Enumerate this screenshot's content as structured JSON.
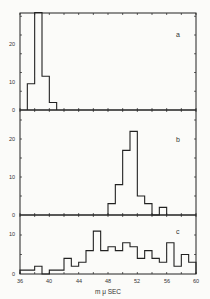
{
  "chart_data": [
    {
      "type": "bar",
      "panel": "a",
      "title": "",
      "xlabel": "",
      "ylabel": "",
      "xlim": [
        36,
        60
      ],
      "ylim": [
        0,
        28
      ],
      "yticks": [
        0,
        10,
        20
      ],
      "bin_width": 1,
      "bins": [
        37,
        38,
        39,
        40
      ],
      "values": [
        7,
        26,
        9,
        2
      ]
    },
    {
      "type": "bar",
      "panel": "b",
      "title": "",
      "xlabel": "",
      "ylabel": "",
      "xlim": [
        36,
        60
      ],
      "ylim": [
        0,
        23
      ],
      "yticks": [
        0,
        10,
        20
      ],
      "bin_width": 1,
      "bins": [
        48,
        49,
        50,
        51,
        52,
        53,
        54,
        55
      ],
      "values": [
        3,
        8,
        17,
        22,
        5,
        3,
        0,
        2
      ]
    },
    {
      "type": "bar",
      "panel": "c",
      "title": "",
      "xlabel": "m μ SEC",
      "ylabel": "",
      "xlim": [
        36,
        60
      ],
      "ylim": [
        0,
        14
      ],
      "yticks": [
        0,
        10
      ],
      "xticks": [
        36,
        40,
        44,
        48,
        52,
        56,
        60
      ],
      "bin_width": 1,
      "bins": [
        36,
        37,
        38,
        39,
        40,
        41,
        42,
        43,
        44,
        45,
        46,
        47,
        48,
        49,
        50,
        51,
        52,
        53,
        54,
        55,
        56,
        57,
        58,
        59
      ],
      "values": [
        1,
        1,
        2,
        0,
        1,
        1,
        4,
        2,
        3,
        6,
        11,
        6,
        7,
        6,
        8,
        7,
        4,
        6,
        4,
        3,
        8,
        2,
        5,
        3
      ]
    }
  ],
  "labels": {
    "panel_a": "a",
    "panel_b": "b",
    "panel_c": "c",
    "xaxis": "m μ SEC",
    "xticks": [
      "36",
      "40",
      "44",
      "48",
      "52",
      "56",
      "60"
    ],
    "ya": [
      "0",
      "10",
      "20"
    ],
    "yb": [
      "0",
      "10",
      "20"
    ],
    "yc": [
      "0",
      "10"
    ]
  },
  "colors": {
    "line": "#222222",
    "background": "#fbfbf9"
  }
}
